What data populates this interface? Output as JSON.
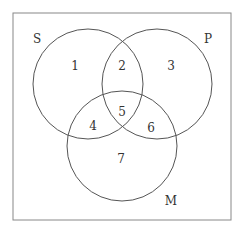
{
  "diagram": {
    "type": "venn",
    "sets": [
      {
        "label": "S",
        "cx": 88,
        "cy": 84,
        "r": 55
      },
      {
        "label": "P",
        "cx": 157,
        "cy": 84,
        "r": 55
      },
      {
        "label": "M",
        "cx": 122,
        "cy": 146,
        "r": 55
      }
    ],
    "regions": [
      {
        "id": "1",
        "x": 75,
        "y": 66
      },
      {
        "id": "2",
        "x": 122,
        "y": 66
      },
      {
        "id": "3",
        "x": 171,
        "y": 66
      },
      {
        "id": "4",
        "x": 93,
        "y": 126
      },
      {
        "id": "5",
        "x": 122,
        "y": 112
      },
      {
        "id": "6",
        "x": 151,
        "y": 128
      },
      {
        "id": "7",
        "x": 121,
        "y": 159
      }
    ],
    "set_labels": [
      {
        "text": "S",
        "x": 37,
        "y": 43
      },
      {
        "text": "P",
        "x": 208,
        "y": 43
      },
      {
        "text": "M",
        "x": 171,
        "y": 205
      }
    ]
  }
}
